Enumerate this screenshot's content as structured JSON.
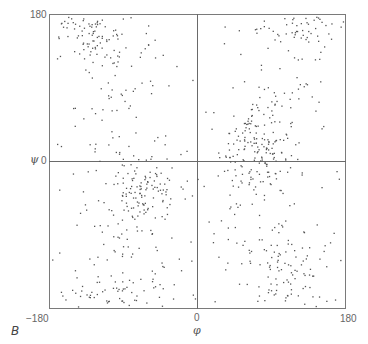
{
  "chart_data": {
    "type": "scatter",
    "title": "",
    "panel_label": "B",
    "xlabel": "φ",
    "ylabel": "ψ",
    "xlim": [
      -180,
      180
    ],
    "ylim": [
      -180,
      180
    ],
    "x_ticks": [
      "−180",
      "0",
      "180"
    ],
    "y_ticks": [
      "180",
      "0"
    ],
    "grid": false,
    "zero_lines": true,
    "point_color": "#555555",
    "clusters": [
      {
        "name": "beta-region-top-left",
        "cx": -130,
        "cy": 160,
        "sx": 30,
        "sy": 20,
        "n": 120
      },
      {
        "name": "upper-left-spread",
        "cx": -90,
        "cy": 90,
        "sx": 35,
        "sy": 50,
        "n": 70
      },
      {
        "name": "alpha-L-region",
        "cx": 70,
        "cy": 15,
        "sx": 22,
        "sy": 28,
        "n": 170
      },
      {
        "name": "upper-right-top-edge",
        "cx": 120,
        "cy": 165,
        "sx": 35,
        "sy": 15,
        "n": 70
      },
      {
        "name": "upper-right-spread",
        "cx": 90,
        "cy": 90,
        "sx": 45,
        "sy": 45,
        "n": 45
      },
      {
        "name": "alpha-R-region",
        "cx": -65,
        "cy": -35,
        "sx": 18,
        "sy": 20,
        "n": 110
      },
      {
        "name": "lower-left-spread",
        "cx": -100,
        "cy": -110,
        "sx": 45,
        "sy": 45,
        "n": 80
      },
      {
        "name": "lower-left-bottom-edge",
        "cx": -110,
        "cy": -165,
        "sx": 40,
        "sy": 12,
        "n": 60
      },
      {
        "name": "lower-right-cluster",
        "cx": 110,
        "cy": -140,
        "sx": 35,
        "sy": 30,
        "n": 110
      },
      {
        "name": "lower-right-spread",
        "cx": 70,
        "cy": -80,
        "sx": 45,
        "sy": 40,
        "n": 40
      },
      {
        "name": "background-uniform",
        "cx": 0,
        "cy": 0,
        "sx": 0,
        "sy": 0,
        "n": 40,
        "uniform": true
      }
    ]
  },
  "labels": {
    "y_top": "180",
    "y_mid": "0",
    "y_symbol": "ψ",
    "x_left": "−180",
    "x_mid": "0",
    "x_right": "180",
    "x_symbol": "φ",
    "panel": "B"
  }
}
